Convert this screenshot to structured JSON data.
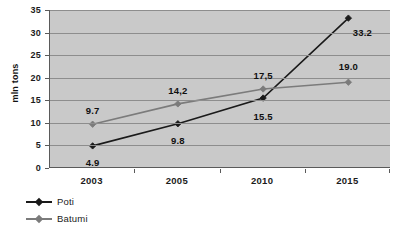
{
  "chart_data": {
    "type": "line",
    "title": "",
    "xlabel": "",
    "ylabel": "mln tons",
    "categories": [
      "2003",
      "2005",
      "2010",
      "2015"
    ],
    "ylim": [
      0,
      35
    ],
    "yticks": [
      "0",
      "5",
      "10",
      "15",
      "20",
      "25",
      "30",
      "35"
    ],
    "grid": "horizontal",
    "legend_position": "bottom-left",
    "series": [
      {
        "name": "Poti",
        "color": "#1a1a1a",
        "marker": "diamond",
        "values": [
          4.9,
          9.8,
          15.5,
          33.2
        ],
        "labels": [
          "4.9",
          "9.8",
          "15.5",
          "33.2"
        ],
        "label_offsets": [
          [
            0,
            16
          ],
          [
            0,
            16
          ],
          [
            0,
            18
          ],
          [
            14,
            14
          ]
        ]
      },
      {
        "name": "Batumi",
        "color": "#7b7b7b",
        "marker": "diamond",
        "values": [
          9.7,
          14.2,
          17.5,
          19.0
        ],
        "labels": [
          "9.7",
          "14,2",
          "17,5",
          "19.0"
        ],
        "label_offsets": [
          [
            0,
            -14
          ],
          [
            0,
            -14
          ],
          [
            0,
            -14
          ],
          [
            0,
            -16
          ]
        ]
      }
    ]
  },
  "legend": {
    "items": [
      {
        "label": "Poti",
        "color": "#1a1a1a"
      },
      {
        "label": "Batumi",
        "color": "#7b7b7b"
      }
    ]
  },
  "axis": {
    "y_title": "mln tons"
  }
}
